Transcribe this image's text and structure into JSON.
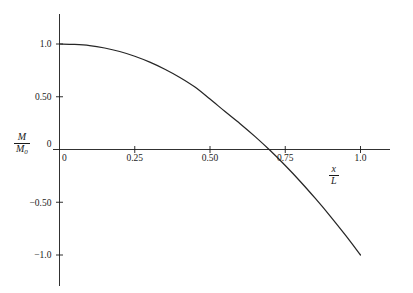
{
  "chart_data": {
    "type": "line",
    "title": "",
    "subtitle": "",
    "xlabel": "x/L",
    "ylabel": "M/M0",
    "xlabel_numerator": "x",
    "xlabel_denominator": "L",
    "ylabel_numerator": "M",
    "ylabel_denominator": "M",
    "ylabel_denominator_sub": "0",
    "xlim": [
      0,
      1.04
    ],
    "ylim": [
      -1.0,
      1.0
    ],
    "grid": false,
    "legend": null,
    "x_ticks": [
      {
        "value": 0,
        "label": "0"
      },
      {
        "value": 0.25,
        "label": "0.25"
      },
      {
        "value": 0.5,
        "label": "0.50"
      },
      {
        "value": 0.75,
        "label": "0.75"
      },
      {
        "value": 1.0,
        "label": "1.0"
      }
    ],
    "y_ticks": [
      {
        "value": 1.0,
        "label": "1.0"
      },
      {
        "value": 0.5,
        "label": "0.50"
      },
      {
        "value": 0.0,
        "label": "0"
      },
      {
        "value": -0.5,
        "label": "-0.50"
      },
      {
        "value": -1.0,
        "label": "-1.0"
      }
    ],
    "series": [
      {
        "name": "M/M0 vs x/L",
        "color": "#262626",
        "x": [
          0.0,
          0.05,
          0.1,
          0.15,
          0.2,
          0.25,
          0.3,
          0.35,
          0.4,
          0.45,
          0.5,
          0.55,
          0.6,
          0.65,
          0.7,
          0.75,
          0.8,
          0.85,
          0.9,
          0.95,
          1.0
        ],
        "y": [
          1.0,
          0.996,
          0.985,
          0.962,
          0.929,
          0.884,
          0.828,
          0.761,
          0.683,
          0.592,
          0.478,
          0.36,
          0.245,
          0.122,
          -0.01,
          -0.152,
          -0.303,
          -0.464,
          -0.633,
          -0.812,
          -1.0
        ]
      }
    ],
    "annotations": [
      {
        "text": "zero crossing near x/L = 0.70"
      }
    ]
  },
  "axes": {
    "x_axis_name": "horizontal-axis",
    "y_axis_name": "vertical-axis"
  }
}
